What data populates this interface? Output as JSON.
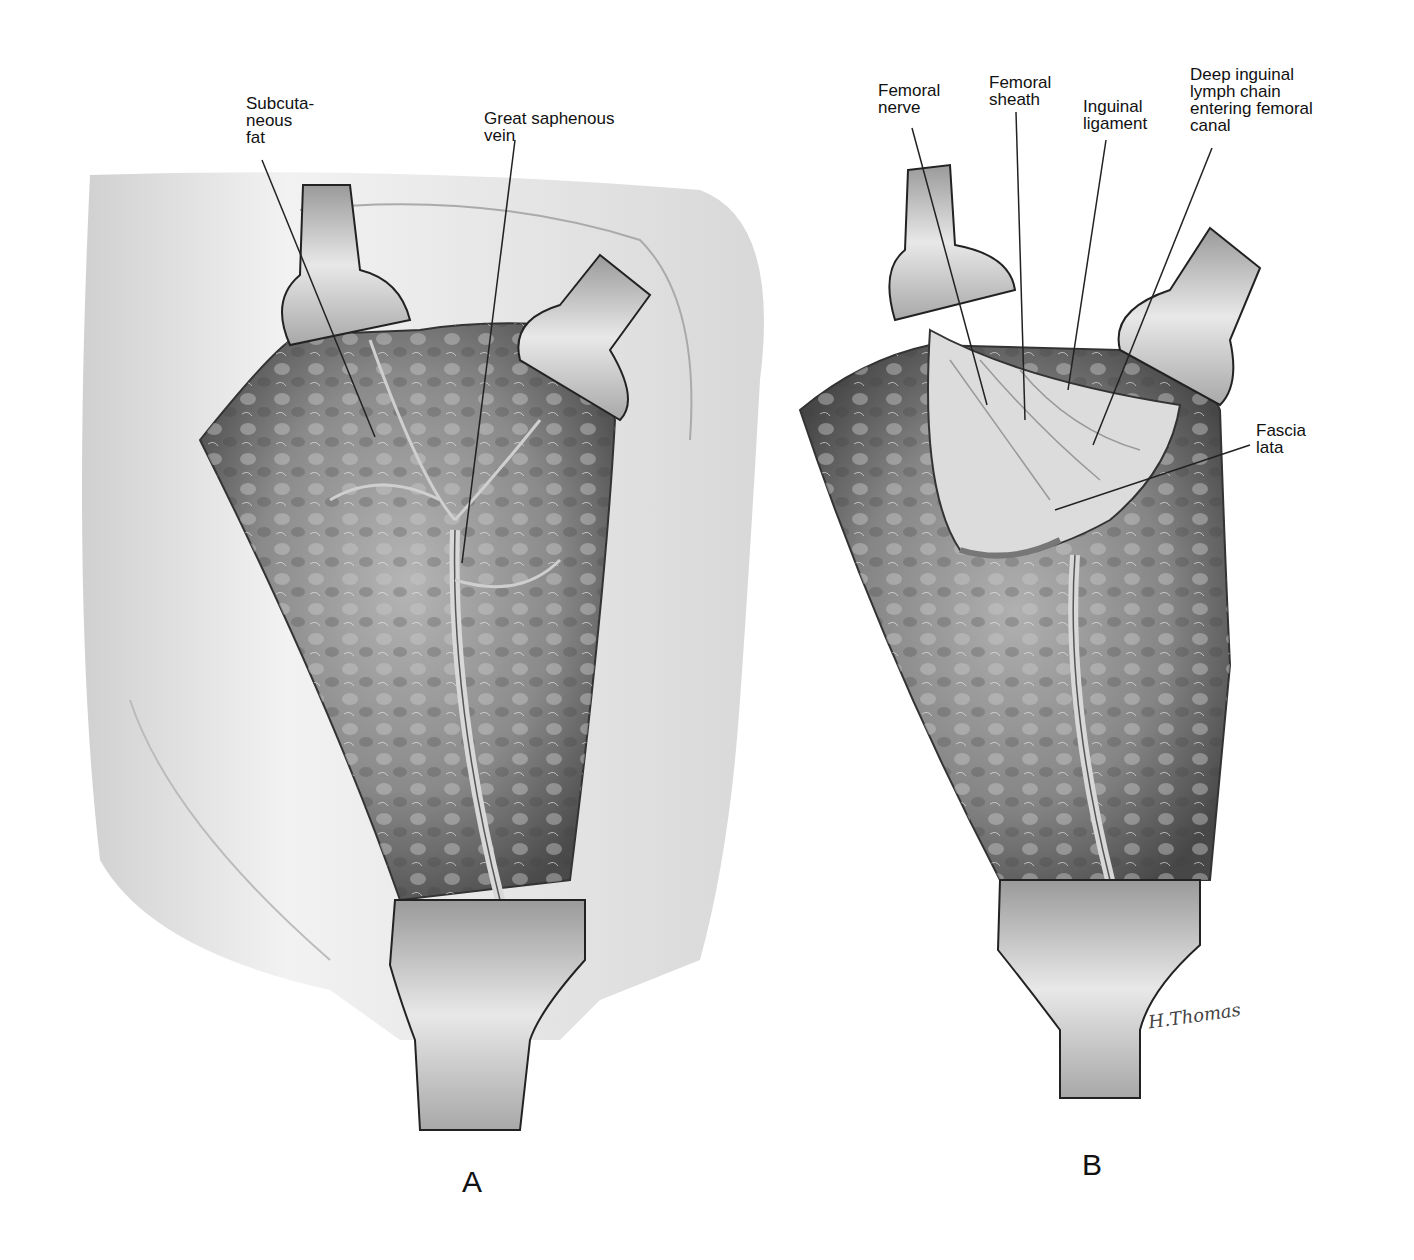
{
  "figure": {
    "panels": [
      {
        "id": "A",
        "letter": "A",
        "labels": [
          {
            "id": "subcutaneous-fat",
            "text": "Subcuta-\n neous\n fat"
          },
          {
            "id": "great-saphenous-vein",
            "text": "Great saphenous\n vein"
          }
        ]
      },
      {
        "id": "B",
        "letter": "B",
        "labels": [
          {
            "id": "femoral-nerve",
            "text": "Femoral\n nerve"
          },
          {
            "id": "femoral-sheath",
            "text": "Femoral\nsheath"
          },
          {
            "id": "inguinal-ligament",
            "text": "Inguinal\n ligament"
          },
          {
            "id": "deep-inguinal-lymph-chain",
            "text": "Deep inguinal\n lymph chain\n entering femoral\n canal"
          },
          {
            "id": "fascia-lata",
            "text": "Fascia\n lata"
          }
        ]
      }
    ],
    "signature": "H.Thomas",
    "colors": {
      "tissue_dark": "#5a5a5a",
      "tissue_mid": "#9a9a9a",
      "skin": "#e6e6e6",
      "retractor": "#cfcfcf",
      "line": "#222222"
    }
  }
}
